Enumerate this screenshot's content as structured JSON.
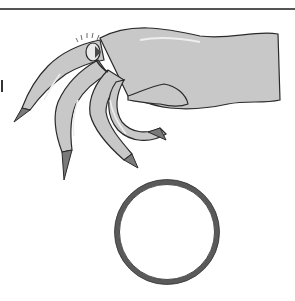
{
  "illustration": {
    "subject": "hand wearing ring above a separate plain ring",
    "colors": {
      "skin": "#c8c8c8",
      "skin_highlight": "#eeeeee",
      "outline": "#2a2a2a",
      "nail": "#7a7a7a",
      "ring_band": "#5a5a5a",
      "rule": "#555555",
      "background": "#ffffff"
    },
    "ring": {
      "cx": 167,
      "cy": 232,
      "r": 50,
      "stroke_width": 5
    }
  }
}
